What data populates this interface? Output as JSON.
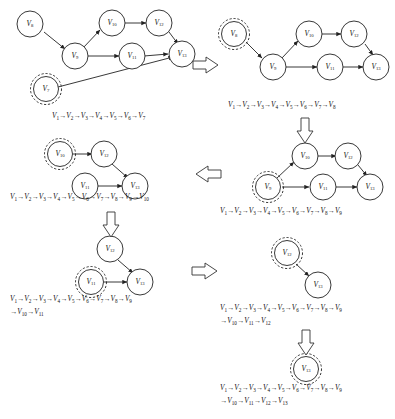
{
  "figure": {
    "node_prefix": "V",
    "accent": "#222222",
    "background": "#ffffff"
  },
  "panels": [
    {
      "id": "panel-1",
      "order": 1,
      "highlight": "V7",
      "nodes": [
        {
          "id": "V8",
          "label": "V",
          "sub": "8"
        },
        {
          "id": "V9",
          "label": "V",
          "sub": "9"
        },
        {
          "id": "V10",
          "label": "V",
          "sub": "10"
        },
        {
          "id": "V11",
          "label": "V",
          "sub": "11"
        },
        {
          "id": "V12",
          "label": "V",
          "sub": "12"
        },
        {
          "id": "V13",
          "label": "V",
          "sub": "13"
        },
        {
          "id": "V7",
          "label": "V",
          "sub": "7"
        }
      ],
      "edges": [
        {
          "from": "V8",
          "to": "V9"
        },
        {
          "from": "V9",
          "to": "V10"
        },
        {
          "from": "V9",
          "to": "V11"
        },
        {
          "from": "V10",
          "to": "V12"
        },
        {
          "from": "V11",
          "to": "V13"
        },
        {
          "from": "V12",
          "to": "V13"
        },
        {
          "from": "V7",
          "to": "V13"
        }
      ],
      "sequence_lines": [
        [
          "V1",
          "V2",
          "V3",
          "V4",
          "V5",
          "V6",
          "V7"
        ]
      ]
    },
    {
      "id": "panel-2",
      "order": 2,
      "highlight": "V8",
      "nodes": [
        {
          "id": "V8",
          "label": "V",
          "sub": "8"
        },
        {
          "id": "V9",
          "label": "V",
          "sub": "9"
        },
        {
          "id": "V10",
          "label": "V",
          "sub": "10"
        },
        {
          "id": "V11",
          "label": "V",
          "sub": "11"
        },
        {
          "id": "V12",
          "label": "V",
          "sub": "12"
        },
        {
          "id": "V13",
          "label": "V",
          "sub": "13"
        }
      ],
      "edges": [
        {
          "from": "V8",
          "to": "V9"
        },
        {
          "from": "V9",
          "to": "V10"
        },
        {
          "from": "V9",
          "to": "V11"
        },
        {
          "from": "V10",
          "to": "V12"
        },
        {
          "from": "V11",
          "to": "V13"
        },
        {
          "from": "V12",
          "to": "V13"
        }
      ],
      "sequence_lines": [
        [
          "V1",
          "V2",
          "V3",
          "V4",
          "V5",
          "V6",
          "V7",
          "V8"
        ]
      ]
    },
    {
      "id": "panel-3",
      "order": 3,
      "highlight": "V9",
      "nodes": [
        {
          "id": "V9",
          "label": "V",
          "sub": "9"
        },
        {
          "id": "V10",
          "label": "V",
          "sub": "10"
        },
        {
          "id": "V11",
          "label": "V",
          "sub": "11"
        },
        {
          "id": "V12",
          "label": "V",
          "sub": "12"
        },
        {
          "id": "V13",
          "label": "V",
          "sub": "13"
        }
      ],
      "edges": [
        {
          "from": "V9",
          "to": "V10"
        },
        {
          "from": "V9",
          "to": "V11"
        },
        {
          "from": "V10",
          "to": "V12"
        },
        {
          "from": "V11",
          "to": "V13"
        },
        {
          "from": "V12",
          "to": "V13"
        }
      ],
      "sequence_lines": [
        [
          "V1",
          "V2",
          "V3",
          "V4",
          "V5",
          "V6",
          "V7",
          "V8",
          "V9"
        ]
      ]
    },
    {
      "id": "panel-4",
      "order": 4,
      "highlight": "V10",
      "nodes": [
        {
          "id": "V10",
          "label": "V",
          "sub": "10"
        },
        {
          "id": "V11",
          "label": "V",
          "sub": "11"
        },
        {
          "id": "V12",
          "label": "V",
          "sub": "12"
        },
        {
          "id": "V13",
          "label": "V",
          "sub": "13"
        }
      ],
      "edges": [
        {
          "from": "V10",
          "to": "V12"
        },
        {
          "from": "V11",
          "to": "V13"
        },
        {
          "from": "V12",
          "to": "V13"
        }
      ],
      "sequence_lines": [
        [
          "V1",
          "V2",
          "V3",
          "V4",
          "V5",
          "V6",
          "V7",
          "V8",
          "V9",
          "V10"
        ]
      ]
    },
    {
      "id": "panel-5",
      "order": 5,
      "highlight": "V11",
      "nodes": [
        {
          "id": "V11",
          "label": "V",
          "sub": "11"
        },
        {
          "id": "V12",
          "label": "V",
          "sub": "12"
        },
        {
          "id": "V13",
          "label": "V",
          "sub": "13"
        }
      ],
      "edges": [
        {
          "from": "V11",
          "to": "V13"
        },
        {
          "from": "V12",
          "to": "V13"
        }
      ],
      "sequence_lines": [
        [
          "V1",
          "V2",
          "V3",
          "V4",
          "V5",
          "V6",
          "V7",
          "V8",
          "V9"
        ],
        [
          "V10",
          "V11"
        ]
      ]
    },
    {
      "id": "panel-6",
      "order": 6,
      "highlight": "V12",
      "nodes": [
        {
          "id": "V12",
          "label": "V",
          "sub": "12"
        },
        {
          "id": "V13",
          "label": "V",
          "sub": "13"
        }
      ],
      "edges": [
        {
          "from": "V12",
          "to": "V13"
        }
      ],
      "sequence_lines": [
        [
          "V1",
          "V2",
          "V3",
          "V4",
          "V5",
          "V6",
          "V7",
          "V8",
          "V9"
        ],
        [
          "V10",
          "V11",
          "V12"
        ]
      ]
    },
    {
      "id": "panel-7",
      "order": 7,
      "highlight": "V13",
      "nodes": [
        {
          "id": "V13",
          "label": "V",
          "sub": "13"
        }
      ],
      "edges": [],
      "sequence_lines": [
        [
          "V1",
          "V2",
          "V3",
          "V4",
          "V5",
          "V6",
          "V7",
          "V8",
          "V9"
        ],
        [
          "V10",
          "V11",
          "V12",
          "V13"
        ]
      ]
    }
  ],
  "flow_arrows": [
    {
      "id": "flow-1-to-2",
      "direction": "right"
    },
    {
      "id": "flow-2-to-3",
      "direction": "down"
    },
    {
      "id": "flow-3-to-4",
      "direction": "left"
    },
    {
      "id": "flow-4-to-5",
      "direction": "down"
    },
    {
      "id": "flow-5-to-6",
      "direction": "right"
    },
    {
      "id": "flow-6-to-7",
      "direction": "down"
    }
  ]
}
